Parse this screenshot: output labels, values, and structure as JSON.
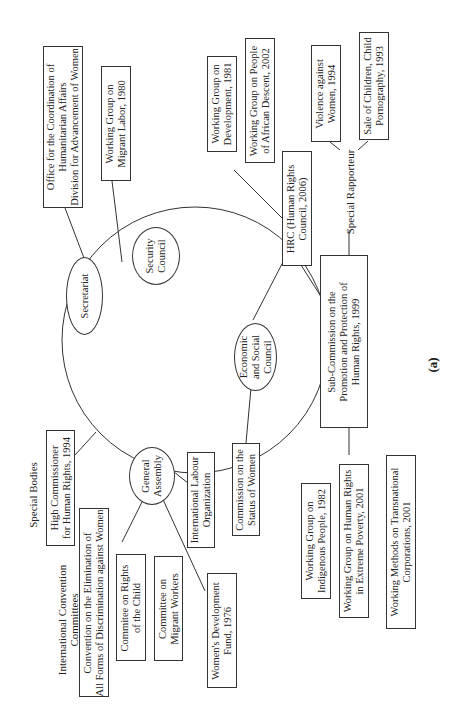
{
  "diagram": {
    "panel_label": "(a)",
    "center_nodes": {
      "secretariat": "Secretariat",
      "security_council": "Security\nCouncil",
      "general_assembly": "General\nAssembly",
      "ecosoc": "Economic\nand Social\nCouncil"
    },
    "secretariat_children": [
      "Office for the Coordination of\nHumanitarian Affairs\nDivision for Advancement of Women"
    ],
    "security_council_children": [
      "Working Group on\nMigrant Labor, 1980"
    ],
    "hrc": "HRC (Human Rights\nCouncil, 2006)",
    "hrc_children": [
      "Working Group on\nDevelopment, 1981",
      "Working Group on People\nof African Descent, 2002"
    ],
    "special_rapporteur_label": "Special Rapporteur",
    "special_rapporteur_children": [
      "Violence against\nWomen, 1994",
      "Sale of Children, Child\nPornography, 1993"
    ],
    "sub_commission": "Sub-Commission on the\nPromotion and Protection of\nHuman Rights, 1999",
    "sub_commission_children": [
      "Working Group on\nIndigenous People, 1982",
      "Working Group on Human Rights\nin Extreme Poverty, 2001",
      "Working Methods on Transnational\nCorporations, 2001"
    ],
    "ecosoc_children": [
      "Commission on the\nStatus of Women"
    ],
    "special_bodies_label": "Special Bodies",
    "special_bodies": [
      "High Commissioner\nfor Human Rights, 1994"
    ],
    "intl_convention_label": "International Convention\nCommittees",
    "intl_convention_committees": [
      "Convention on the Elimination of\nAll Forms of Discrimination against Women",
      "Commitee on Rights\nof the Child",
      "Committee on\nMigrant Workers"
    ],
    "general_assembly_children": [
      "International Labour\nOrganization",
      "Women's Development\nFund, 1976"
    ]
  }
}
